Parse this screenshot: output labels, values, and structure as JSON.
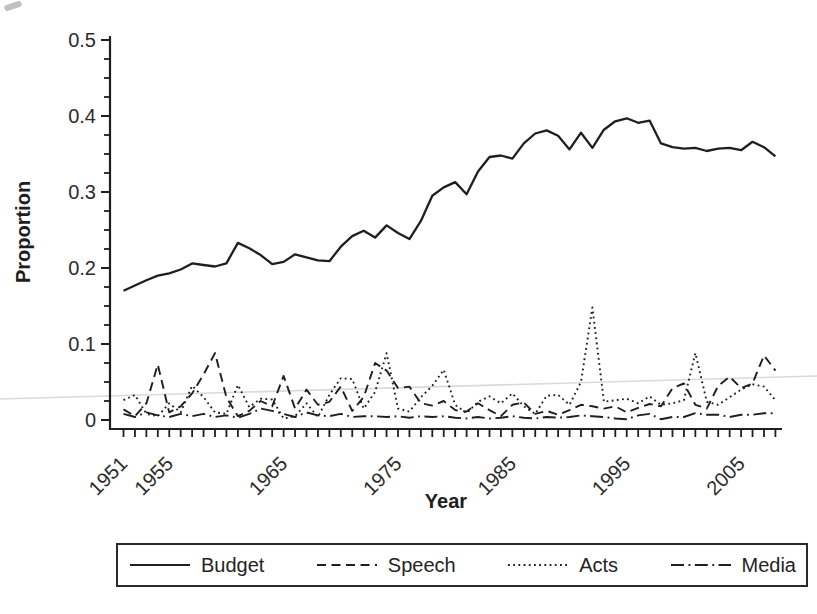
{
  "chart_data": {
    "type": "line",
    "title": "",
    "xlabel": "Year",
    "ylabel": "Proportion",
    "x_range": [
      1951,
      2008
    ],
    "ylim": [
      0,
      0.52
    ],
    "grid": false,
    "legend_position": "bottom",
    "line_color": "#1f1f1f",
    "scan_artifact_line_color": "#d9d9d9",
    "y_ticks": {
      "major": [
        0,
        0.1,
        0.2,
        0.3,
        0.4,
        0.5
      ],
      "major_labels": [
        "0",
        "0.1",
        "0.2",
        "0.3",
        "0.4",
        "0.5"
      ],
      "minor_step": 0.025
    },
    "x_tick_every_year": true,
    "x_tick_labels": [
      1951,
      1955,
      1965,
      1975,
      1985,
      1995,
      2005
    ],
    "x": [
      1951,
      1952,
      1953,
      1954,
      1955,
      1956,
      1957,
      1958,
      1959,
      1960,
      1961,
      1962,
      1963,
      1964,
      1965,
      1966,
      1967,
      1968,
      1969,
      1970,
      1971,
      1972,
      1973,
      1974,
      1975,
      1976,
      1977,
      1978,
      1979,
      1980,
      1981,
      1982,
      1983,
      1984,
      1985,
      1986,
      1987,
      1988,
      1989,
      1990,
      1991,
      1992,
      1993,
      1994,
      1995,
      1996,
      1997,
      1998,
      1999,
      2000,
      2001,
      2002,
      2003,
      2004,
      2005,
      2006,
      2007,
      2008
    ],
    "series": [
      {
        "name": "Budget",
        "line_style": "solid",
        "values": [
          0.17,
          0.177,
          0.184,
          0.19,
          0.193,
          0.198,
          0.206,
          0.204,
          0.202,
          0.206,
          0.233,
          0.226,
          0.217,
          0.205,
          0.208,
          0.218,
          0.214,
          0.21,
          0.209,
          0.228,
          0.242,
          0.249,
          0.24,
          0.256,
          0.246,
          0.238,
          0.262,
          0.295,
          0.306,
          0.313,
          0.297,
          0.327,
          0.346,
          0.348,
          0.344,
          0.364,
          0.377,
          0.381,
          0.374,
          0.356,
          0.378,
          0.358,
          0.382,
          0.393,
          0.397,
          0.391,
          0.394,
          0.364,
          0.359,
          0.357,
          0.358,
          0.354,
          0.357,
          0.358,
          0.355,
          0.366,
          0.359,
          0.347
        ]
      },
      {
        "name": "Speech",
        "line_style": "dashed",
        "values": [
          0.014,
          0.005,
          0.022,
          0.073,
          0.01,
          0.018,
          0.035,
          0.06,
          0.088,
          0.03,
          0.005,
          0.012,
          0.025,
          0.018,
          0.058,
          0.015,
          0.04,
          0.02,
          0.024,
          0.044,
          0.012,
          0.03,
          0.075,
          0.065,
          0.042,
          0.044,
          0.022,
          0.019,
          0.025,
          0.013,
          0.011,
          0.022,
          0.013,
          0.005,
          0.02,
          0.023,
          0.008,
          0.012,
          0.007,
          0.013,
          0.02,
          0.018,
          0.015,
          0.018,
          0.01,
          0.016,
          0.021,
          0.018,
          0.042,
          0.048,
          0.02,
          0.015,
          0.045,
          0.057,
          0.042,
          0.048,
          0.085,
          0.065
        ]
      },
      {
        "name": "Acts",
        "line_style": "dotted",
        "values": [
          0.026,
          0.033,
          0.008,
          0.005,
          0.022,
          0.01,
          0.045,
          0.03,
          0.01,
          0.008,
          0.046,
          0.017,
          0.028,
          0.027,
          0.002,
          0.005,
          0.022,
          0.004,
          0.033,
          0.055,
          0.054,
          0.015,
          0.037,
          0.088,
          0.015,
          0.011,
          0.03,
          0.045,
          0.066,
          0.02,
          0.009,
          0.024,
          0.031,
          0.022,
          0.035,
          0.018,
          0.008,
          0.032,
          0.033,
          0.02,
          0.05,
          0.148,
          0.024,
          0.026,
          0.028,
          0.022,
          0.031,
          0.02,
          0.022,
          0.026,
          0.088,
          0.024,
          0.02,
          0.03,
          0.04,
          0.047,
          0.044,
          0.026
        ]
      },
      {
        "name": "Media",
        "line_style": "dash-dot",
        "values": [
          0.008,
          0.004,
          0.01,
          0.006,
          0.004,
          0.008,
          0.005,
          0.008,
          0.004,
          0.006,
          0.003,
          0.008,
          0.015,
          0.012,
          0.008,
          0.004,
          0.01,
          0.006,
          0.005,
          0.008,
          0.004,
          0.005,
          0.005,
          0.004,
          0.005,
          0.003,
          0.005,
          0.004,
          0.005,
          0.003,
          0.002,
          0.004,
          0.002,
          0.003,
          0.005,
          0.003,
          0.002,
          0.004,
          0.003,
          0.004,
          0.006,
          0.005,
          0.004,
          0.002,
          0.001,
          0.006,
          0.008,
          0.001,
          0.004,
          0.004,
          0.009,
          0.007,
          0.007,
          0.004,
          0.007,
          0.007,
          0.009,
          0.009
        ]
      }
    ]
  }
}
